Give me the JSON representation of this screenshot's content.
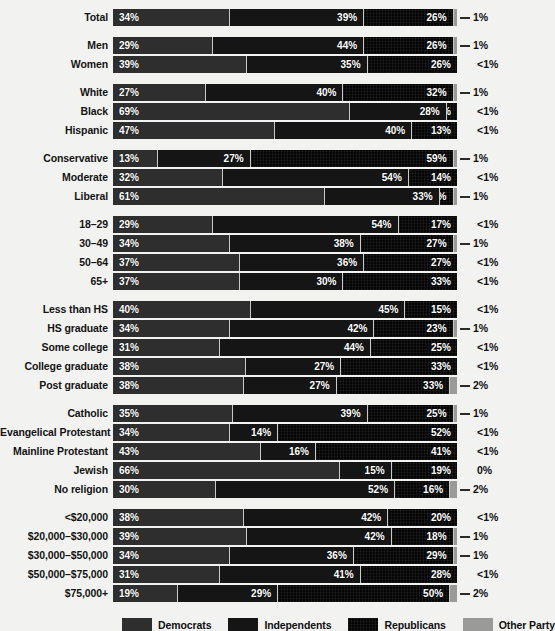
{
  "chart_data": {
    "type": "bar",
    "subtype": "stacked-horizontal-100",
    "title": "",
    "xlabel": "",
    "ylabel": "",
    "xlim": [
      0,
      100
    ],
    "grid": false,
    "legend_position": "bottom",
    "series": [
      {
        "name": "Democrats",
        "key": "dem",
        "color": "#2e2e2e"
      },
      {
        "name": "Independents",
        "key": "ind",
        "color": "#151515"
      },
      {
        "name": "Republicans",
        "key": "rep",
        "color": "#050505"
      },
      {
        "name": "Other Party",
        "key": "oth",
        "color": "#9a9a98"
      }
    ],
    "categories": [
      "Total",
      "Men",
      "Women",
      "White",
      "Black",
      "Hispanic",
      "Conservative",
      "Moderate",
      "Liberal",
      "18–29",
      "30–49",
      "50–64",
      "65+",
      "Less than HS",
      "HS graduate",
      "Some college",
      "College graduate",
      "Post graduate",
      "Catholic",
      "Evangelical Protestant",
      "Mainline Protestant",
      "Jewish",
      "No religion",
      "<$20,000",
      "$20,000–$30,000",
      "$30,000–$50,000",
      "$50,000–$75,000",
      "$75,000+"
    ],
    "groups": [
      {
        "name": "overall",
        "rows": [
          {
            "label": "Total",
            "values": [
              34,
              39,
              26,
              1
            ],
            "labels": [
              "34%",
              "39%",
              "26%"
            ],
            "other_label": "1%",
            "other_leader": true
          }
        ]
      },
      {
        "name": "gender",
        "rows": [
          {
            "label": "Men",
            "values": [
              29,
              44,
              26,
              1
            ],
            "labels": [
              "29%",
              "44%",
              "26%"
            ],
            "other_label": "1%",
            "other_leader": true
          },
          {
            "label": "Women",
            "values": [
              39,
              35,
              26,
              0
            ],
            "labels": [
              "39%",
              "35%",
              "26%"
            ],
            "other_label": "<1%",
            "other_leader": false
          }
        ]
      },
      {
        "name": "race",
        "rows": [
          {
            "label": "White",
            "values": [
              27,
              40,
              32,
              1
            ],
            "labels": [
              "27%",
              "40%",
              "32%"
            ],
            "other_label": "1%",
            "other_leader": true
          },
          {
            "label": "Black",
            "values": [
              69,
              28,
              3,
              0
            ],
            "labels": [
              "69%",
              "28%",
              "3%"
            ],
            "other_label": "<1%",
            "other_leader": false
          },
          {
            "label": "Hispanic",
            "values": [
              47,
              40,
              13,
              0
            ],
            "labels": [
              "47%",
              "40%",
              "13%"
            ],
            "other_label": "<1%",
            "other_leader": false
          }
        ]
      },
      {
        "name": "ideology",
        "rows": [
          {
            "label": "Conservative",
            "values": [
              13,
              27,
              59,
              1
            ],
            "labels": [
              "13%",
              "27%",
              "59%"
            ],
            "other_label": "1%",
            "other_leader": true
          },
          {
            "label": "Moderate",
            "values": [
              32,
              54,
              14,
              0
            ],
            "labels": [
              "32%",
              "54%",
              "14%"
            ],
            "other_label": "<1%",
            "other_leader": false
          },
          {
            "label": "Liberal",
            "values": [
              61,
              33,
              4,
              1
            ],
            "labels": [
              "61%",
              "33%",
              "4%"
            ],
            "other_label": "1%",
            "other_leader": true
          }
        ]
      },
      {
        "name": "age",
        "rows": [
          {
            "label": "18–29",
            "values": [
              29,
              54,
              17,
              0
            ],
            "labels": [
              "29%",
              "54%",
              "17%"
            ],
            "other_label": "<1%",
            "other_leader": false
          },
          {
            "label": "30–49",
            "values": [
              34,
              38,
              27,
              1
            ],
            "labels": [
              "34%",
              "38%",
              "27%"
            ],
            "other_label": "1%",
            "other_leader": true
          },
          {
            "label": "50–64",
            "values": [
              37,
              36,
              27,
              0
            ],
            "labels": [
              "37%",
              "36%",
              "27%"
            ],
            "other_label": "<1%",
            "other_leader": false
          },
          {
            "label": "65+",
            "values": [
              37,
              30,
              33,
              0
            ],
            "labels": [
              "37%",
              "30%",
              "33%"
            ],
            "other_label": "<1%",
            "other_leader": false
          }
        ]
      },
      {
        "name": "education",
        "rows": [
          {
            "label": "Less than HS",
            "values": [
              40,
              45,
              15,
              0
            ],
            "labels": [
              "40%",
              "45%",
              "15%"
            ],
            "other_label": "<1%",
            "other_leader": false
          },
          {
            "label": "HS graduate",
            "values": [
              34,
              42,
              23,
              1
            ],
            "labels": [
              "34%",
              "42%",
              "23%"
            ],
            "other_label": "1%",
            "other_leader": true
          },
          {
            "label": "Some college",
            "values": [
              31,
              44,
              25,
              0
            ],
            "labels": [
              "31%",
              "44%",
              "25%"
            ],
            "other_label": "<1%",
            "other_leader": false
          },
          {
            "label": "College graduate",
            "values": [
              38,
              27,
              33,
              0
            ],
            "labels": [
              "38%",
              "27%",
              "33%"
            ],
            "other_label": "<1%",
            "other_leader": false
          },
          {
            "label": "Post graduate",
            "values": [
              38,
              27,
              33,
              2
            ],
            "labels": [
              "38%",
              "27%",
              "33%"
            ],
            "other_label": "2%",
            "other_leader": true
          }
        ]
      },
      {
        "name": "religion",
        "rows": [
          {
            "label": "Catholic",
            "values": [
              35,
              39,
              25,
              1
            ],
            "labels": [
              "35%",
              "39%",
              "25%"
            ],
            "other_label": "1%",
            "other_leader": true
          },
          {
            "label": "Evangelical Protestant",
            "values": [
              34,
              14,
              52,
              0
            ],
            "labels": [
              "34%",
              "14%",
              "52%"
            ],
            "other_label": "<1%",
            "other_leader": false
          },
          {
            "label": "Mainline Protestant",
            "values": [
              43,
              16,
              41,
              0
            ],
            "labels": [
              "43%",
              "16%",
              "41%"
            ],
            "other_label": "<1%",
            "other_leader": false
          },
          {
            "label": "Jewish",
            "values": [
              66,
              15,
              19,
              0
            ],
            "labels": [
              "66%",
              "15%",
              "19%"
            ],
            "other_label": "0%",
            "other_leader": false
          },
          {
            "label": "No religion",
            "values": [
              30,
              52,
              16,
              2
            ],
            "labels": [
              "30%",
              "52%",
              "16%"
            ],
            "other_label": "2%",
            "other_leader": true
          }
        ]
      },
      {
        "name": "income",
        "rows": [
          {
            "label": "<$20,000",
            "values": [
              38,
              42,
              20,
              0
            ],
            "labels": [
              "38%",
              "42%",
              "20%"
            ],
            "other_label": "<1%",
            "other_leader": false
          },
          {
            "label": "$20,000–$30,000",
            "values": [
              39,
              42,
              18,
              1
            ],
            "labels": [
              "39%",
              "42%",
              "18%"
            ],
            "other_label": "1%",
            "other_leader": true
          },
          {
            "label": "$30,000–$50,000",
            "values": [
              34,
              36,
              29,
              1
            ],
            "labels": [
              "34%",
              "36%",
              "29%"
            ],
            "other_label": "1%",
            "other_leader": true
          },
          {
            "label": "$50,000–$75,000",
            "values": [
              31,
              41,
              28,
              0
            ],
            "labels": [
              "31%",
              "41%",
              "28%"
            ],
            "other_label": "<1%",
            "other_leader": false
          },
          {
            "label": "$75,000+",
            "values": [
              19,
              29,
              50,
              2
            ],
            "labels": [
              "19%",
              "29%",
              "50%"
            ],
            "other_label": "2%",
            "other_leader": true
          }
        ]
      }
    ],
    "legend": [
      {
        "label": "Democrats",
        "color": "#2e2e2e"
      },
      {
        "label": "Independents",
        "color": "#151515"
      },
      {
        "label": "Republicans",
        "color": "#050505"
      },
      {
        "label": "Other Party",
        "color": "#9a9a98"
      }
    ]
  }
}
